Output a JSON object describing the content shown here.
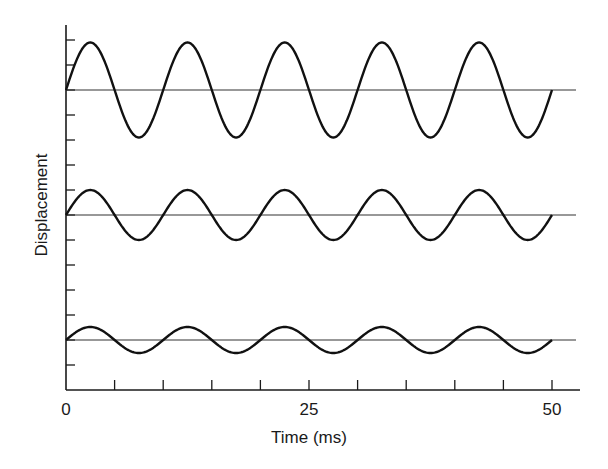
{
  "chart_data": {
    "type": "line",
    "title": "",
    "xlabel": "Time (ms)",
    "ylabel": "Displacement",
    "xlim": [
      0,
      52.5
    ],
    "x_ticks": [
      0,
      5,
      10,
      15,
      20,
      25,
      30,
      35,
      40,
      45,
      50
    ],
    "x_tick_labels": [
      {
        "value": 0,
        "label": "0"
      },
      {
        "value": 25,
        "label": "25"
      },
      {
        "value": 50,
        "label": "50"
      }
    ],
    "y_tick_count": 14,
    "y_tick_labels": [],
    "grid": false,
    "legend": null,
    "series": [
      {
        "name": "Wave 1 (large amplitude)",
        "function": "sine",
        "period_ms": 10,
        "amplitude_ticks": 1.9,
        "baseline_tick": 2,
        "t_start": 0,
        "t_end": 50
      },
      {
        "name": "Wave 2 (medium amplitude)",
        "function": "sine",
        "period_ms": 10,
        "amplitude_ticks": 1.0,
        "baseline_tick": 7,
        "t_start": 0,
        "t_end": 50
      },
      {
        "name": "Wave 3 (small amplitude)",
        "function": "sine",
        "period_ms": 10,
        "amplitude_ticks": 0.52,
        "baseline_tick": 12,
        "t_start": 0,
        "t_end": 50
      }
    ]
  },
  "layout": {
    "origin_x": 66,
    "x_axis_y": 390,
    "y_axis_top": 25,
    "x_axis_right": 580,
    "px_per_ms": 9.72,
    "first_y_tick": 40,
    "y_tick_spacing": 25.0,
    "baseline_right": 576
  }
}
